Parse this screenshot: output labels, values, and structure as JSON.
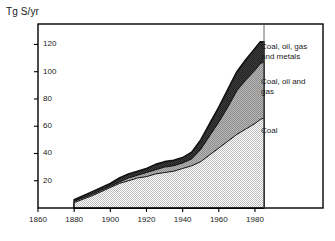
{
  "chart_data": {
    "type": "area",
    "title": "Tg S/yr",
    "xlabel": "",
    "ylabel": "Tg S/yr",
    "xlim": [
      1860,
      1995
    ],
    "ylim": [
      0,
      135
    ],
    "xticks": [
      1860,
      1880,
      1900,
      1920,
      1940,
      1960,
      1980
    ],
    "yticks": [
      20,
      40,
      60,
      80,
      100,
      120
    ],
    "grid": false,
    "stacked": true,
    "legend_position": "right-inside-plot",
    "x": [
      1880,
      1890,
      1900,
      1905,
      1910,
      1915,
      1920,
      1925,
      1930,
      1935,
      1940,
      1945,
      1950,
      1955,
      1960,
      1965,
      1970,
      1975,
      1980,
      1983,
      1985
    ],
    "series": [
      {
        "name": "Coal",
        "label": "Coal",
        "color": "#d9d9d9",
        "values": [
          4,
          9,
          15,
          18,
          20,
          22,
          23,
          25,
          26,
          27,
          29,
          31,
          34,
          39,
          44,
          49,
          54,
          58,
          62,
          65,
          66
        ]
      },
      {
        "name": "Coal, oil and gas",
        "label": "Coal, oil and\ngas",
        "color": "#a6a6a6",
        "values": [
          5,
          10,
          16,
          19,
          22,
          24,
          26,
          28,
          30,
          31,
          33,
          36,
          43,
          53,
          63,
          74,
          86,
          94,
          101,
          106,
          107
        ]
      },
      {
        "name": "Coal, oil, gas and metals",
        "label": "Coal, oil, gas\nand metals",
        "color": "#3a3a3a",
        "values": [
          6,
          12,
          18,
          22,
          25,
          27,
          29,
          32,
          34,
          35,
          37,
          41,
          50,
          62,
          74,
          87,
          100,
          109,
          117,
          122,
          122
        ]
      }
    ],
    "legend_entries": [
      {
        "label": "Coal, oil, gas\nand metals",
        "x": 261,
        "y": 42
      },
      {
        "label": "Coal, oil and\ngas",
        "x": 261,
        "y": 77
      },
      {
        "label": "Coal",
        "x": 261,
        "y": 126
      }
    ],
    "y_tick_labels": [
      {
        "text": "120",
        "value": 120
      },
      {
        "text": "100",
        "value": 100
      },
      {
        "text": "80",
        "value": 80
      },
      {
        "text": "60",
        "value": 60
      },
      {
        "text": "40",
        "value": 40
      },
      {
        "text": "20",
        "value": 20
      }
    ],
    "x_tick_labels": [
      {
        "text": "1860",
        "value": 1860
      },
      {
        "text": "1880",
        "value": 1880
      },
      {
        "text": "1900",
        "value": 1900
      },
      {
        "text": "1920",
        "value": 1920
      },
      {
        "text": "1940",
        "value": 1940
      },
      {
        "text": "1960",
        "value": 1960
      },
      {
        "text": "1980",
        "value": 1980
      }
    ],
    "colors": {
      "axis": "#000000",
      "frame": "#000000",
      "text": "#1a1a1a",
      "background": "#ffffff",
      "coal": "#d9d9d9",
      "oil_gas": "#a6a6a6",
      "metals": "#3a3a3a"
    }
  }
}
